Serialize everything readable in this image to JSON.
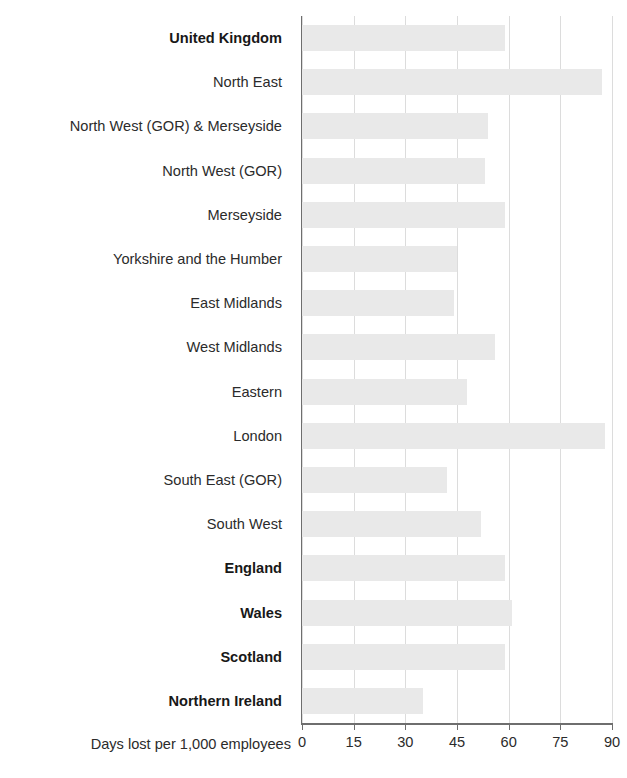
{
  "chart_data": {
    "type": "bar",
    "orientation": "horizontal",
    "title": "",
    "subtitle": "",
    "xlabel": "Days lost per 1,000 employees",
    "ylabel": "",
    "xlim": [
      0,
      90
    ],
    "xticks": [
      0,
      15,
      30,
      45,
      60,
      75,
      90
    ],
    "xtick_labels": [
      "0",
      "15",
      "30",
      "45",
      "60",
      "75",
      "90"
    ],
    "grid": true,
    "grid_axis": "x",
    "legend": false,
    "legend_position": "none",
    "bar_color": "#e9e9e9",
    "axis_color": "#6e6e6e",
    "grid_color": "#dcdcdc",
    "categories": [
      "United Kingdom",
      "North East",
      "North West (GOR) & Merseyside",
      "North West (GOR)",
      "Merseyside",
      "Yorkshire and the Humber",
      "East Midlands",
      "West Midlands",
      "Eastern",
      "London",
      "South East (GOR)",
      "South West",
      "England",
      "Wales",
      "Scotland",
      "Northern Ireland"
    ],
    "bold_categories": [
      "United Kingdom",
      "England",
      "Wales",
      "Scotland",
      "Northern Ireland"
    ],
    "values": [
      59,
      87,
      54,
      53,
      59,
      45,
      44,
      56,
      48,
      88,
      42,
      52,
      59,
      61,
      59,
      35
    ]
  }
}
